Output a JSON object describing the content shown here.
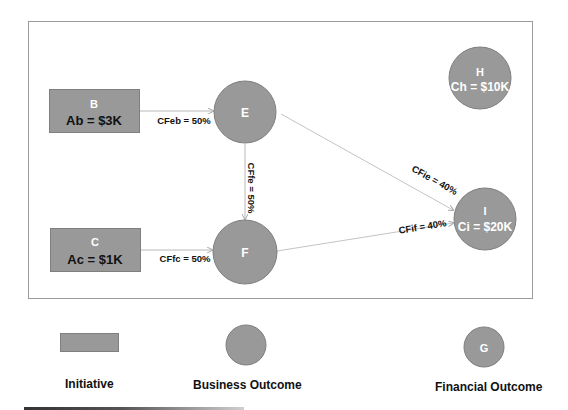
{
  "colors": {
    "node_fill": "#999999",
    "node_stroke": "#7f7f7f",
    "edge": "#b8b8b8",
    "frame": "#9a9a9a",
    "label_dark": "#111111",
    "label_light": "#ffffff"
  },
  "nodes": {
    "B": {
      "id": "B",
      "value": "Ab = $3K",
      "type": "initiative"
    },
    "C": {
      "id": "C",
      "value": "Ac = $1K",
      "type": "initiative"
    },
    "E": {
      "id": "E",
      "type": "business_outcome"
    },
    "F": {
      "id": "F",
      "type": "business_outcome"
    },
    "H": {
      "id": "H",
      "value": "Ch = $10K",
      "type": "financial_outcome"
    },
    "I": {
      "id": "I",
      "value": "Ci = $20K",
      "type": "financial_outcome"
    }
  },
  "edges": {
    "eb": {
      "from": "B",
      "to": "E",
      "label": "CFeb = 50%"
    },
    "fc": {
      "from": "C",
      "to": "F",
      "label": "CFfc = 50%"
    },
    "fe": {
      "from": "E",
      "to": "F",
      "label": "CFfe = 50%"
    },
    "ie": {
      "from": "E",
      "to": "I",
      "label": "CFie = 40%"
    },
    "if": {
      "from": "F",
      "to": "I",
      "label": "CFif = 40%"
    }
  },
  "legend": {
    "initiative": {
      "label": "Initiative"
    },
    "business_outcome": {
      "label": "Business Outcome"
    },
    "financial_outcome": {
      "label": "Financial Outcome",
      "symbol_text": "G"
    }
  }
}
